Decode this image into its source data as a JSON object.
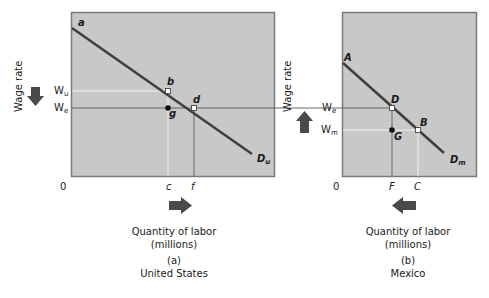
{
  "colors": {
    "panel_fill": "#c8c8c8",
    "panel_border": "#7a7a7a",
    "demand_line": "#3e3e3e",
    "guide_dark": "#666666",
    "guide_light": "#f2f2f2",
    "arrow": "#4a4a4a"
  },
  "panel_a": {
    "y_axis_label": "Wage rate",
    "origin": "0",
    "wage_labels": {
      "wu": "W",
      "wu_sub": "u",
      "we": "W",
      "we_sub": "e"
    },
    "points": {
      "a": "a",
      "b": "b",
      "d": "d",
      "g": "g"
    },
    "demand_label": "D",
    "demand_sub": "u",
    "x_ticks": {
      "c": "c",
      "f": "f"
    },
    "x_axis_label_line1": "Quantity of labor",
    "x_axis_label_line2": "(millions)",
    "panel_id": "(a)",
    "country": "United States",
    "wage_arrow": "down",
    "quantity_arrow": "right"
  },
  "panel_b": {
    "y_axis_label": "Wage rate",
    "origin": "0",
    "wage_labels": {
      "we": "W",
      "we_sub": "e",
      "wm": "W",
      "wm_sub": "m"
    },
    "points": {
      "A": "A",
      "D": "D",
      "B": "B",
      "G": "G"
    },
    "demand_label": "D",
    "demand_sub": "m",
    "x_ticks": {
      "F": "F",
      "C": "C"
    },
    "x_axis_label_line1": "Quantity of labor",
    "x_axis_label_line2": "(millions)",
    "panel_id": "(b)",
    "country": "Mexico",
    "wage_arrow": "up",
    "quantity_arrow": "left"
  }
}
